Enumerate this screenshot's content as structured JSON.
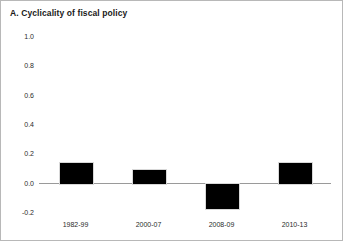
{
  "chart_data": {
    "type": "bar",
    "title": "A. Cyclicality of fiscal policy",
    "xlabel": "",
    "ylabel": "",
    "categories": [
      "1982-99",
      "2000-07",
      "2008-09",
      "2010-13"
    ],
    "values": [
      0.14,
      0.09,
      -0.17,
      0.14
    ],
    "ylim": [
      -0.2,
      1.0
    ],
    "yticks": [
      1.0,
      0.8,
      0.6,
      0.4,
      0.2,
      0.0,
      -0.2
    ],
    "ytick_labels": [
      "1.0",
      "0.8",
      "0.6",
      "0.4",
      "0.2",
      "0.0",
      "-0.2"
    ],
    "grid": false,
    "legend": null,
    "zero_line": true,
    "series": [
      {
        "name": "Cyclicality of fiscal policy",
        "values": [
          0.14,
          0.09,
          -0.17,
          0.14
        ],
        "color": "#000000"
      }
    ]
  },
  "colors": {
    "bar": "#000000",
    "bar_edge": "#d8d8d8",
    "axis_line": "#9a9a9a",
    "text": "#2b2b2b",
    "frame": "#b8b8b8",
    "background": "#ffffff"
  }
}
